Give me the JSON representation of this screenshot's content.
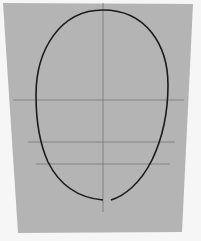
{
  "image": {
    "subject": "head proportion guide drawing on gray paper",
    "colors": {
      "background": "#f6f6f6",
      "paper": "#b4b4b4",
      "guide_line": "#777777",
      "outline": "#1a1a1a"
    }
  }
}
